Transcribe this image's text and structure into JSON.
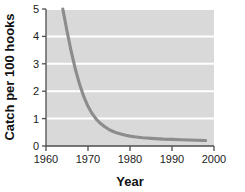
{
  "chart_data": {
    "type": "line",
    "title": "",
    "subtitle": "",
    "xlabel": "Year",
    "ylabel": "Catch per 100 hooks",
    "xlim": [
      1960,
      2000
    ],
    "ylim": [
      0,
      5
    ],
    "xticks": [
      1960,
      1970,
      1980,
      1990,
      2000
    ],
    "xtick_labels": [
      "1960",
      "1970",
      "1980",
      "1990",
      "2000"
    ],
    "yticks": [
      0,
      1,
      2,
      3,
      4,
      5
    ],
    "ytick_labels": [
      "0",
      "1",
      "2",
      "3",
      "4",
      "5"
    ],
    "grid": "horizontal-white",
    "legend": "none",
    "panel_color": "#d9d9d9",
    "gridline_color": "#ffffff",
    "line_color": "#8c8c8c",
    "axis_color": "#4d4d4d",
    "series": [
      {
        "name": "Catch rate",
        "x": [
          1964.0,
          1965.0,
          1966.0,
          1967.0,
          1968.0,
          1969.0,
          1970.0,
          1971.0,
          1972.0,
          1973.0,
          1974.0,
          1975.0,
          1976.0,
          1977.0,
          1978.0,
          1979.0,
          1980.0,
          1981.0,
          1982.0,
          1983.0,
          1984.0,
          1985.0,
          1986.0,
          1988.0,
          1990.0,
          1992.0,
          1994.0,
          1996.0,
          1998.0
        ],
        "values": [
          5.0,
          4.2,
          3.45,
          2.8,
          2.25,
          1.8,
          1.45,
          1.18,
          0.97,
          0.82,
          0.7,
          0.6,
          0.53,
          0.47,
          0.43,
          0.39,
          0.36,
          0.34,
          0.32,
          0.3,
          0.29,
          0.28,
          0.27,
          0.25,
          0.24,
          0.23,
          0.22,
          0.21,
          0.2
        ]
      }
    ]
  },
  "annotations": {
    "axis_x_title": "Year",
    "axis_y_title": "Catch per 100 hooks"
  }
}
